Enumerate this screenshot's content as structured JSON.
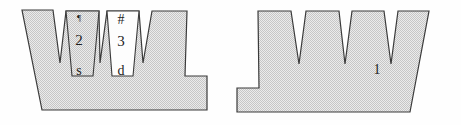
{
  "figure": {
    "width": 461,
    "height": 125,
    "background_color": "#fefefe",
    "fill_color": "#d9d9d9",
    "fill_pattern": "halftone-dither",
    "white_fill_color": "#fdfdfd",
    "stroke_color": "#3a3a3a",
    "stroke_width": "1.2"
  },
  "shapes": [
    {
      "name": "left-profile",
      "points": "22,10 53,10 60,63 66,11 99,11 100,63 107,11 139,11 143,63 152,11 187,11 185,76 207,76 207,110 42,110",
      "fill": "pattern",
      "notch_count": 3
    },
    {
      "name": "left-tooth-panel-inner",
      "points": "66,11 99,11 93,76 72,76",
      "fill": "pattern"
    },
    {
      "name": "left-tooth-panel-white",
      "points": "107,11 139,11 133,76 112,76",
      "fill": "white"
    },
    {
      "name": "right-profile",
      "points": "258,11 291,11 299,64 306,11 339,11 345,64 352,11 384,11 391,64 398,11 429,11 410,112 237,112 237,88 259,88",
      "fill": "pattern",
      "notch_count": 3
    }
  ],
  "annotations": [
    {
      "name": "mark-pilcrow",
      "text": "¶",
      "x": 79,
      "y": 18,
      "size": "sm"
    },
    {
      "name": "label-2",
      "text": "2",
      "x": 79,
      "y": 40,
      "size": "lg"
    },
    {
      "name": "label-s",
      "text": "s",
      "x": 79,
      "y": 71,
      "size": "md"
    },
    {
      "name": "mark-hash",
      "text": "#",
      "x": 121,
      "y": 20,
      "size": "md"
    },
    {
      "name": "label-3",
      "text": "3",
      "x": 121,
      "y": 41,
      "size": "lg"
    },
    {
      "name": "label-d",
      "text": "d",
      "x": 121,
      "y": 71,
      "size": "md"
    },
    {
      "name": "label-1",
      "text": "1",
      "x": 377,
      "y": 70,
      "size": "md"
    }
  ]
}
